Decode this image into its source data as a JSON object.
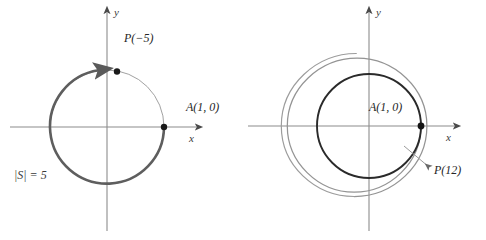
{
  "figure": {
    "background_color": "#ffffff",
    "panels": [
      {
        "id": "left",
        "name": "unit-circle-single-wrap",
        "center": {
          "x": 107,
          "y": 127
        },
        "radius": 57,
        "axes": {
          "x_label": "x",
          "y_label": "y",
          "x_min": 10,
          "x_max": 200,
          "y_min": 8,
          "y_max": 231,
          "color": "#8c8c8c"
        },
        "circle": {
          "thin_color": "#9a9a9a",
          "thick_color": "#5a5a5a",
          "arc_start_deg": 0,
          "arc_end_deg": 99,
          "arc_direction": "clockwise",
          "arrow_at_deg": 99
        },
        "points": [
          {
            "name": "point-A",
            "label": "A(1, 0)",
            "angle_deg": 0
          },
          {
            "name": "point-P",
            "label": "P(−5)",
            "angle_deg": 80
          }
        ],
        "set_label": "|S| = 5"
      },
      {
        "id": "right",
        "name": "unit-circle-multiple-wrap",
        "center": {
          "x": 126,
          "y": 126
        },
        "radius": 52,
        "axes": {
          "x_label": "x",
          "y_label": "y",
          "x_min": 5,
          "x_max": 215,
          "y_min": 8,
          "y_max": 231,
          "color": "#8c8c8c"
        },
        "circle": {
          "inner_color": "#1f1f1f",
          "spiral_color": "#8f8f8f",
          "spiral_turns": 2,
          "spiral_growth_px": 17
        },
        "points": [
          {
            "name": "point-A",
            "label": "A(1, 0)",
            "angle_deg": 0
          }
        ],
        "annotations": [
          {
            "name": "point-P-callout",
            "label": "P(12)",
            "arrow_from": {
              "x": 186,
              "y": 167
            },
            "arrow_to": {
              "x": 163,
              "y": 148
            }
          }
        ]
      }
    ]
  }
}
